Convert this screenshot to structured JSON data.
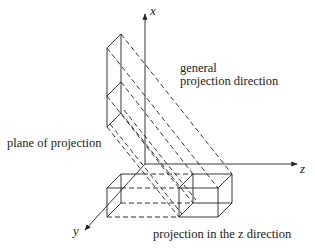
{
  "axes": {
    "x": "x",
    "y": "y",
    "z": "z"
  },
  "labels": {
    "general_line1": "general",
    "general_line2": "projection direction",
    "plane": "plane of projection",
    "z_projection": "projection in the z direction"
  },
  "colors": {
    "ink": "#222222",
    "background": "#ffffff"
  }
}
